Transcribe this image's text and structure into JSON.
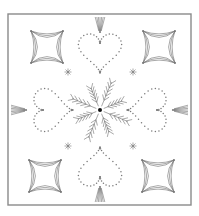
{
  "pattern": {
    "frame": {
      "x": 8,
      "y": 14,
      "width": 183,
      "height": 191,
      "color": "#8a8a8a"
    },
    "center": {
      "x": 100,
      "y": 110
    },
    "stars": [
      {
        "name": "star-top-left",
        "cx": 47,
        "cy": 47
      },
      {
        "name": "star-top-right",
        "cx": 159,
        "cy": 47
      },
      {
        "name": "star-bottom-left",
        "cx": 45,
        "cy": 176
      },
      {
        "name": "star-bottom-right",
        "cx": 158,
        "cy": 176
      }
    ],
    "asterisks": [
      {
        "cx": 68,
        "cy": 72
      },
      {
        "cx": 133,
        "cy": 72
      },
      {
        "cx": 68,
        "cy": 146
      },
      {
        "cx": 133,
        "cy": 146
      }
    ],
    "hearts": [
      "top",
      "right",
      "bottom",
      "left"
    ],
    "line_color": "#6e6e6e",
    "dot_color": "#7a7a7a"
  }
}
